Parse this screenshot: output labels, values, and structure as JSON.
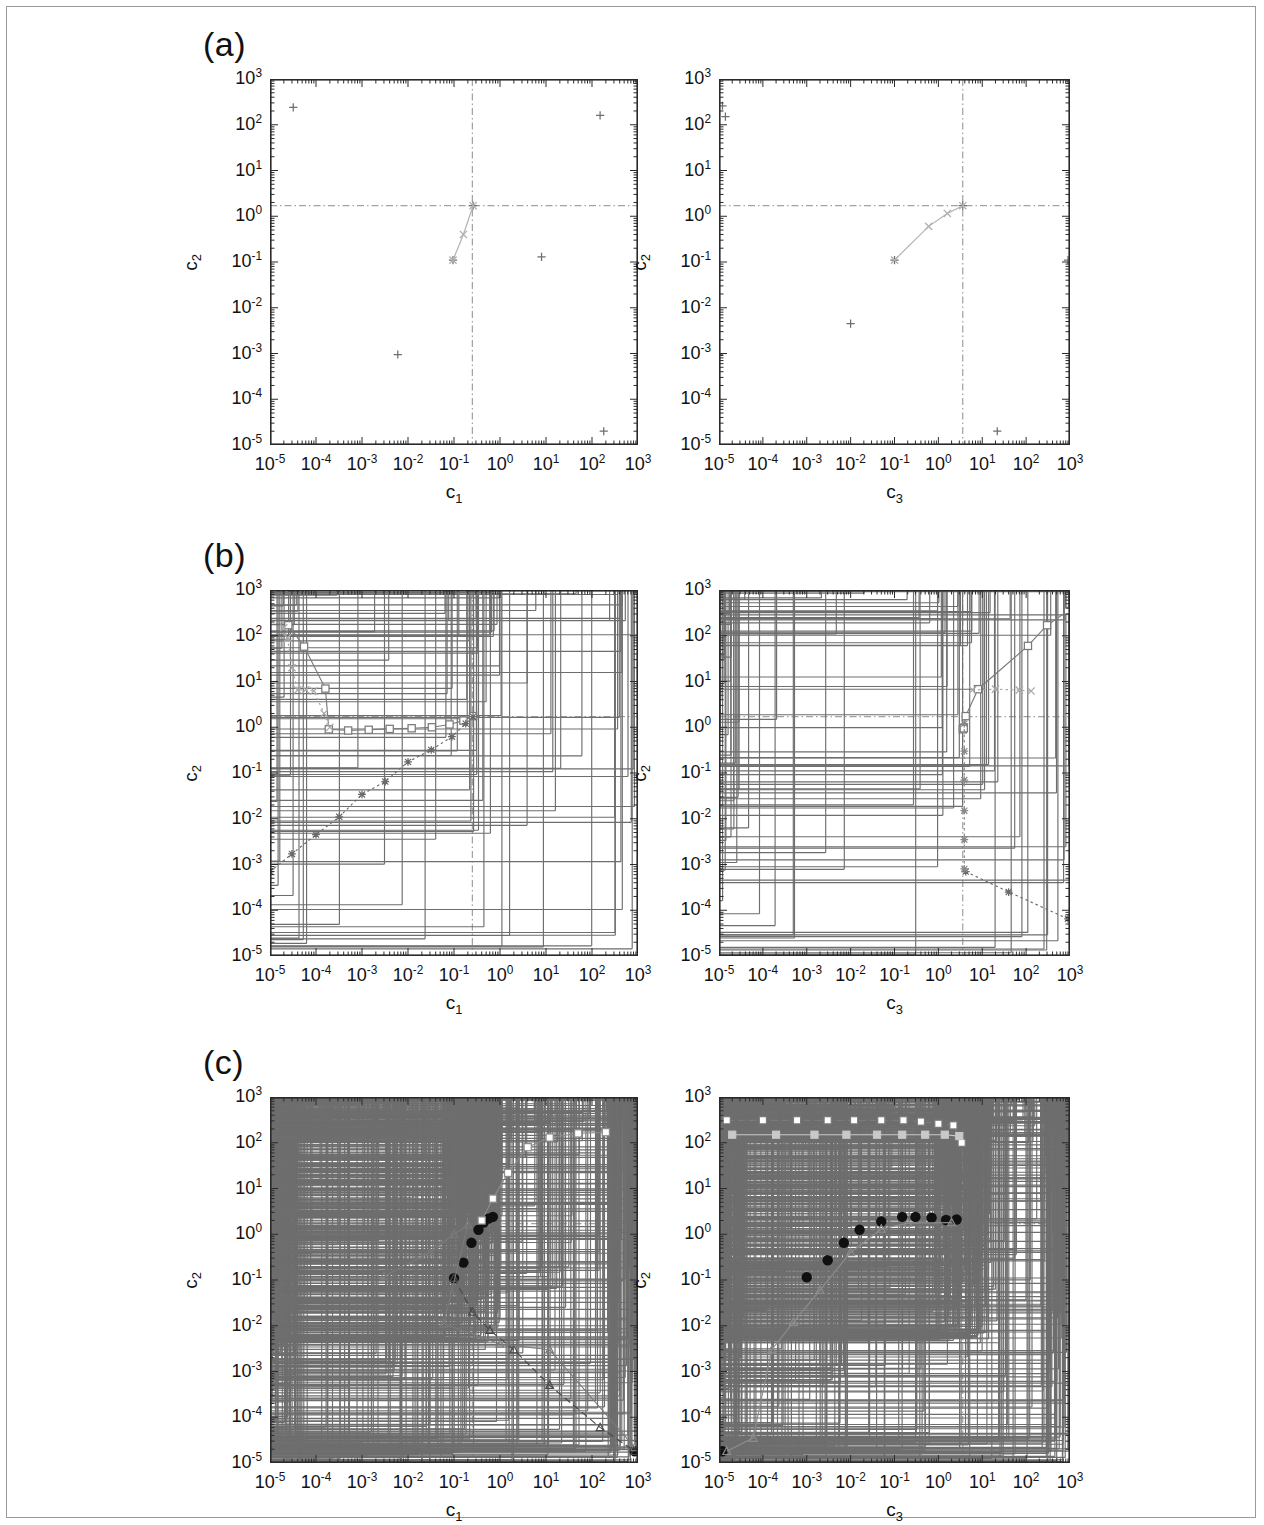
{
  "figure": {
    "panel_labels": [
      "(a)",
      "(b)",
      "(c)"
    ],
    "axis_titles": {
      "x_left": "c1",
      "x_right": "c3",
      "y": "c2"
    },
    "axis_title_base": "c",
    "axis_title_subs": {
      "x_left": "1",
      "x_right": "3",
      "y": "2"
    },
    "tick_base": "10",
    "x_tick_exponents": [
      "-5",
      "-4",
      "-3",
      "-2",
      "-1",
      "0",
      "1",
      "2",
      "3"
    ],
    "y_tick_exponents": [
      "3",
      "2",
      "1",
      "0",
      "-1",
      "-2",
      "-3",
      "-4",
      "-5"
    ],
    "colors": {
      "frame": "#2a2a2a",
      "marker_plus": "#6e6e6e",
      "marker_plus_dark": "#4a4a4a",
      "open_square": "#7a7a7a",
      "cross_x": "#9a9a9a",
      "triangle": "#8d8d8d",
      "filled_circle": "#101010",
      "light_gray": "#c9c9c9",
      "reference_line": "#8c8c8c",
      "page_border": "#9a9a9a"
    },
    "reference_lines": {
      "horizontal_c2": 1.7,
      "vertical_c1": 0.25,
      "vertical_c3": 3.6,
      "style": "dash-dot"
    },
    "caption_fragment": ""
  },
  "chart_data": [
    {
      "id": "a-left",
      "type": "scatter",
      "panel": "(a)",
      "xlabel": "c1",
      "ylabel": "c2",
      "xlim": [
        1e-05,
        1000.0
      ],
      "ylim": [
        1e-05,
        1000.0
      ],
      "xscale": "log",
      "yscale": "log",
      "grid": false,
      "legend": null,
      "vline": 0.25,
      "hline": 1.7,
      "series": [
        {
          "name": "samples",
          "marker": "plus",
          "color": "#6e6e6e",
          "points": [
            [
              3.2e-05,
              240.0
            ],
            [
              150.0,
              160.0
            ],
            [
              1e-05,
              0.0045
            ],
            [
              0.006,
              0.00095
            ],
            [
              0.095,
              0.11
            ],
            [
              8.0,
              0.13
            ],
            [
              0.26,
              1.7
            ],
            [
              180.0,
              2e-05
            ]
          ]
        },
        {
          "name": "trace",
          "marker": "cross",
          "color": "#b0b0b0",
          "line": "solid",
          "points": [
            [
              0.095,
              0.11
            ],
            [
              0.16,
              0.4
            ],
            [
              0.26,
              1.7
            ]
          ]
        }
      ]
    },
    {
      "id": "a-right",
      "type": "scatter",
      "panel": "(a)",
      "xlabel": "c3",
      "ylabel": "c2",
      "xlim": [
        1e-05,
        1000.0
      ],
      "ylim": [
        1e-05,
        1000.0
      ],
      "xscale": "log",
      "yscale": "log",
      "grid": false,
      "legend": null,
      "vline": 3.6,
      "hline": 1.7,
      "series": [
        {
          "name": "samples",
          "marker": "plus",
          "color": "#6e6e6e",
          "points": [
            [
              1.2e-05,
              260.0
            ],
            [
              1.4e-05,
              150.0
            ],
            [
              0.01,
              0.0045
            ],
            [
              1e-05,
              0.00095
            ],
            [
              0.1,
              0.11
            ],
            [
              900.0,
              0.11
            ],
            [
              3.6,
              1.7
            ],
            [
              22.0,
              2e-05
            ]
          ]
        },
        {
          "name": "trace",
          "marker": "cross",
          "color": "#b0b0b0",
          "line": "solid",
          "points": [
            [
              0.1,
              0.11
            ],
            [
              0.6,
              0.6
            ],
            [
              1.6,
              1.15
            ],
            [
              3.6,
              1.7
            ]
          ]
        }
      ]
    },
    {
      "id": "b-left",
      "type": "scatter",
      "panel": "(b)",
      "xlabel": "c1",
      "ylabel": "c2",
      "xlim": [
        1e-05,
        1000.0
      ],
      "ylim": [
        1e-05,
        1000.0
      ],
      "xscale": "log",
      "yscale": "log",
      "grid": false,
      "legend": null,
      "vline": 0.25,
      "hline": 1.7,
      "n_scatter_points": 95,
      "series": [
        {
          "name": "open-square-path",
          "marker": "open-square",
          "color": "#7a7a7a",
          "line": "solid",
          "points": [
            [
              2.5e-05,
              170.0
            ],
            [
              5.5e-05,
              58.0
            ],
            [
              0.00016,
              7.0
            ],
            [
              0.00019,
              0.9
            ],
            [
              0.0005,
              0.85
            ],
            [
              0.0014,
              0.88
            ],
            [
              0.004,
              0.92
            ],
            [
              0.012,
              0.95
            ],
            [
              0.033,
              1.0
            ],
            [
              0.08,
              1.15
            ],
            [
              0.16,
              1.4
            ],
            [
              0.26,
              1.75
            ]
          ]
        },
        {
          "name": "x-path",
          "marker": "cross",
          "color": "#a8a8a8",
          "line": "dotted",
          "points": [
            [
              2e-05,
              150.0
            ],
            [
              2.4e-05,
              90.0
            ],
            [
              3e-05,
              20.0
            ],
            [
              4e-05,
              6.5
            ],
            [
              6e-05,
              6.6
            ],
            [
              9e-05,
              6.2
            ],
            [
              0.00015,
              2.0
            ],
            [
              0.0002,
              1.0
            ]
          ]
        },
        {
          "name": "star-diagonal",
          "marker": "star",
          "color": "#6a6a6a",
          "line": "dotted",
          "points": [
            [
              1e-05,
              0.0007
            ],
            [
              3e-05,
              0.0017
            ],
            [
              0.0001,
              0.0045
            ],
            [
              0.00032,
              0.011
            ],
            [
              0.001,
              0.034
            ],
            [
              0.0032,
              0.065
            ],
            [
              0.01,
              0.175
            ],
            [
              0.032,
              0.32
            ],
            [
              0.09,
              0.62
            ],
            [
              0.18,
              1.2
            ],
            [
              0.26,
              1.7
            ]
          ]
        }
      ]
    },
    {
      "id": "b-right",
      "type": "scatter",
      "panel": "(b)",
      "xlabel": "c3",
      "ylabel": "c2",
      "xlim": [
        1e-05,
        1000.0
      ],
      "ylim": [
        1e-05,
        1000.0
      ],
      "xscale": "log",
      "yscale": "log",
      "grid": false,
      "legend": null,
      "vline": 3.6,
      "hline": 1.7,
      "n_scatter_points": 95,
      "series": [
        {
          "name": "open-square-path",
          "marker": "open-square",
          "color": "#7a7a7a",
          "line": "solid",
          "points": [
            [
              3.6,
              0.9
            ],
            [
              3.8,
              0.95
            ],
            [
              4.2,
              1.75
            ],
            [
              8.0,
              6.8
            ],
            [
              110.0,
              60.0
            ],
            [
              300.0,
              170.0
            ],
            [
              900.0,
              350.0
            ]
          ]
        },
        {
          "name": "x-path",
          "marker": "cross",
          "color": "#a8a8a8",
          "line": "dotted",
          "points": [
            [
              6.0,
              6.5
            ],
            [
              20.0,
              6.8
            ],
            [
              70.0,
              6.5
            ],
            [
              130.0,
              6.2
            ]
          ]
        },
        {
          "name": "descending-dotted",
          "marker": "star",
          "color": "#6a6a6a",
          "line": "dotted",
          "points": [
            [
              4.2,
              0.0007
            ],
            [
              40.0,
              0.00025
            ],
            [
              900.0,
              6.5e-05
            ]
          ]
        },
        {
          "name": "vertical-spine",
          "marker": "star",
          "color": "#8a8a8a",
          "line": "dotted",
          "points": [
            [
              3.9,
              1.2
            ],
            [
              3.9,
              0.3
            ],
            [
              3.9,
              0.07
            ],
            [
              3.9,
              0.015
            ],
            [
              3.9,
              0.0035
            ],
            [
              3.9,
              0.0008
            ]
          ]
        }
      ]
    },
    {
      "id": "c-left",
      "type": "scatter",
      "panel": "(c)",
      "xlabel": "c1",
      "ylabel": "c2",
      "xlim": [
        1e-05,
        1000.0
      ],
      "ylim": [
        1e-05,
        1000.0
      ],
      "xscale": "log",
      "yscale": "log",
      "grid": false,
      "legend": null,
      "vline": 0.25,
      "hline": 1.7,
      "n_scatter_points": 900,
      "series": [
        {
          "name": "filled-circles",
          "marker": "filled-circle",
          "color": "#101010",
          "points": [
            [
              0.1,
              0.11
            ],
            [
              0.16,
              0.24
            ],
            [
              0.24,
              0.65
            ],
            [
              0.34,
              1.25
            ],
            [
              0.44,
              1.8
            ],
            [
              0.56,
              2.2
            ],
            [
              0.7,
              2.4
            ],
            [
              850.0,
              1.8e-05
            ]
          ]
        },
        {
          "name": "open-square-path",
          "marker": "open-square",
          "color": "#8a8a8a",
          "line": "solid",
          "points": [
            [
              0.4,
              2.0
            ],
            [
              0.7,
              6.0
            ],
            [
              1.5,
              22.0
            ],
            [
              4.0,
              80.0
            ],
            [
              12.0,
              130.0
            ],
            [
              50.0,
              160.0
            ],
            [
              200.0,
              170.0
            ]
          ]
        },
        {
          "name": "descending-dashed",
          "marker": "triangle",
          "color": "#4a4a4a",
          "line": "dashed",
          "points": [
            [
              0.1,
              0.11
            ],
            [
              0.25,
              0.02
            ],
            [
              0.6,
              0.008
            ],
            [
              2.0,
              0.003
            ],
            [
              12.0,
              0.0005
            ],
            [
              150.0,
              6e-05
            ],
            [
              850.0,
              1.8e-05
            ]
          ]
        },
        {
          "name": "descending-solid",
          "marker": "triangle",
          "color": "#7a7a7a",
          "line": "solid",
          "points": [
            [
              0.003,
              0.12
            ],
            [
              0.03,
              0.4
            ],
            [
              0.1,
              1.0
            ],
            [
              0.2,
              1.6
            ],
            [
              0.06,
              0.011
            ],
            [
              1.0,
              0.004
            ],
            [
              12.0,
              0.003
            ],
            [
              850.0,
              2.2e-05
            ]
          ]
        }
      ]
    },
    {
      "id": "c-right",
      "type": "scatter",
      "panel": "(c)",
      "xlabel": "c3",
      "ylabel": "c2",
      "xlim": [
        1e-05,
        1000.0
      ],
      "ylim": [
        1e-05,
        1000.0
      ],
      "xscale": "log",
      "yscale": "log",
      "grid": false,
      "legend": null,
      "vline": 3.6,
      "hline": 1.7,
      "n_scatter_points": 900,
      "series": [
        {
          "name": "filled-circles",
          "marker": "filled-circle",
          "color": "#101010",
          "points": [
            [
              1.2e-05,
              1.8e-05
            ],
            [
              0.001,
              0.115
            ],
            [
              0.003,
              0.27
            ],
            [
              0.007,
              0.65
            ],
            [
              0.016,
              1.25
            ],
            [
              0.05,
              1.9
            ],
            [
              0.15,
              2.4
            ],
            [
              0.3,
              2.4
            ],
            [
              0.7,
              2.3
            ],
            [
              1.5,
              2.05
            ],
            [
              2.6,
              2.1
            ]
          ]
        },
        {
          "name": "triangle-path",
          "marker": "triangle",
          "color": "#8d8d8d",
          "line": "solid",
          "points": [
            [
              1.5e-05,
              1.8e-05
            ],
            [
              6e-05,
              3.5e-05
            ],
            [
              0.00016,
              0.003
            ],
            [
              0.0005,
              0.012
            ],
            [
              0.002,
              0.06
            ],
            [
              0.01,
              0.4
            ],
            [
              0.05,
              1.3
            ],
            [
              0.2,
              1.75
            ],
            [
              2.0,
              1.8
            ]
          ]
        },
        {
          "name": "open-square-top",
          "marker": "open-square",
          "color": "#7a7a7a",
          "line": "dashed",
          "points": [
            [
              1.5e-05,
              310.0
            ],
            [
              0.0001,
              310.0
            ],
            [
              0.0006,
              310.0
            ],
            [
              0.003,
              310.0
            ],
            [
              0.012,
              310.0
            ],
            [
              0.05,
              310.0
            ],
            [
              0.16,
              310.0
            ],
            [
              0.4,
              290.0
            ],
            [
              1.0,
              260.0
            ],
            [
              2.2,
              240.0
            ],
            [
              3.4,
              100.0
            ]
          ]
        },
        {
          "name": "light-square-top",
          "marker": "filled-square",
          "color": "#c9c9c9",
          "line": "solid",
          "points": [
            [
              2e-05,
              150.0
            ],
            [
              0.0002,
              150.0
            ],
            [
              0.0015,
              150.0
            ],
            [
              0.008,
              150.0
            ],
            [
              0.04,
              150.0
            ],
            [
              0.15,
              150.0
            ],
            [
              0.5,
              150.0
            ],
            [
              1.4,
              150.0
            ],
            [
              3.0,
              140.0
            ]
          ]
        }
      ]
    }
  ]
}
